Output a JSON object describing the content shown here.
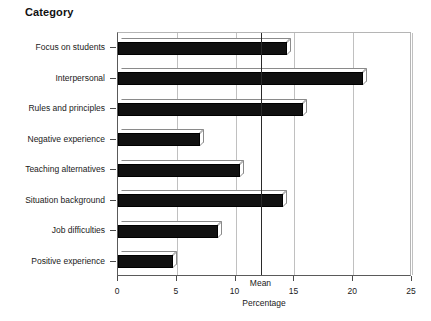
{
  "chart_data": {
    "type": "bar",
    "orientation": "horizontal",
    "title": "Category",
    "xlabel": "Percentage",
    "ylabel": "",
    "xlim": [
      0,
      25
    ],
    "xticks": [
      "0",
      "5",
      "10",
      "15",
      "20",
      "25"
    ],
    "grid": true,
    "legend": null,
    "categories": [
      "Focus on students",
      "Interpersonal",
      "Rules and principles",
      "Negative experience",
      "Teaching alternatives",
      "Situation background",
      "Job difficulties",
      "Positive experience"
    ],
    "values": [
      14.4,
      20.8,
      15.7,
      7.0,
      10.4,
      14.0,
      8.5,
      4.7
    ],
    "annotations": [
      {
        "label": "Mean",
        "value": 12.2,
        "kind": "vertical-reference-line"
      }
    ],
    "style": {
      "bar_fill": "#111111",
      "bar_edge": "#000000",
      "grid_color": "#c0c0c0",
      "axis_color": "#5a5a5a",
      "mean_line_color": "#2a2a2a",
      "background": "#ffffff"
    }
  }
}
